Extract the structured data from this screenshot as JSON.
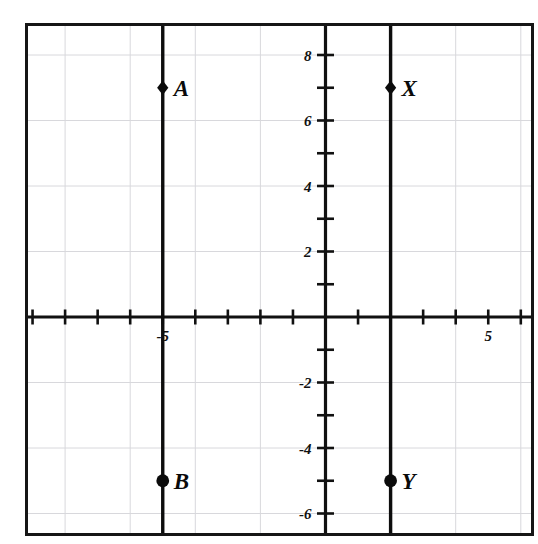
{
  "figure": {
    "background_color": "#ffffff",
    "border_color": "#161616",
    "axis_color": "#111111",
    "grid_color": "#d8d8dc",
    "line_color": "#0d0d0d",
    "marker_color": "#0b0b0b"
  },
  "chart_data": {
    "type": "scatter",
    "title": "",
    "xlabel": "",
    "ylabel": "",
    "xlim": [
      -9,
      6.5
    ],
    "ylim": [
      -7,
      9
    ],
    "grid": true,
    "grid_step": 2,
    "tick_step": 1,
    "legend": "none",
    "x_tick_labels": [
      {
        "value": -5,
        "text": "-5"
      },
      {
        "value": 5,
        "text": "5"
      }
    ],
    "y_tick_labels": [
      {
        "value": 8,
        "text": "8"
      },
      {
        "value": 6,
        "text": "6"
      },
      {
        "value": 4,
        "text": "4"
      },
      {
        "value": 2,
        "text": "2"
      },
      {
        "value": -2,
        "text": "-2"
      },
      {
        "value": -4,
        "text": "-4"
      },
      {
        "value": -6,
        "text": "-6"
      }
    ],
    "points": [
      {
        "label": "A",
        "x": -5,
        "y": 7,
        "marker": "diamond"
      },
      {
        "label": "X",
        "x": 2,
        "y": 7,
        "marker": "diamond"
      },
      {
        "label": "B",
        "x": -5,
        "y": -5,
        "marker": "circle"
      },
      {
        "label": "Y",
        "x": 2,
        "y": -5,
        "marker": "circle"
      }
    ],
    "vertical_lines": [
      {
        "name": "line-AB",
        "x": -5,
        "from_y": 9,
        "to_y": -7
      },
      {
        "name": "line-XY",
        "x": 2,
        "from_y": 9,
        "to_y": -7
      }
    ],
    "series": [
      {
        "name": "segment-AB",
        "x": [
          -5,
          -5
        ],
        "values": [
          7,
          -5
        ]
      },
      {
        "name": "segment-XY",
        "x": [
          2,
          2
        ],
        "values": [
          7,
          -5
        ]
      }
    ]
  }
}
